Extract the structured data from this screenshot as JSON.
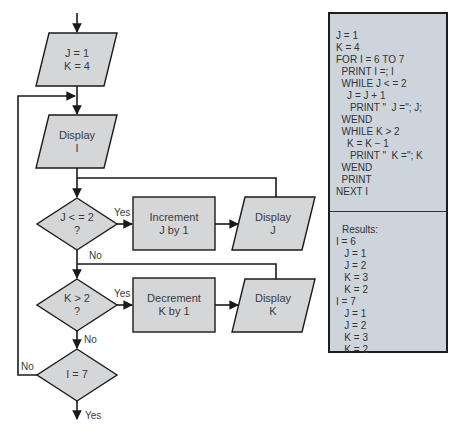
{
  "flowchart": {
    "nodes": {
      "init": {
        "line1": "J = 1",
        "line2": "K = 4"
      },
      "display_i": {
        "line1": "Display",
        "line2": "I"
      },
      "decision_j": {
        "line1": "J < = 2",
        "line2": "?"
      },
      "increment_j": {
        "line1": "Increment",
        "line2": "J by 1"
      },
      "display_j": {
        "line1": "Display",
        "line2": "J"
      },
      "decision_k": {
        "line1": "K > 2",
        "line2": "?"
      },
      "decrement_k": {
        "line1": "Decrement",
        "line2": "K by 1"
      },
      "display_k": {
        "line1": "Display",
        "line2": "K"
      },
      "decision_i": {
        "line1": "I = 7"
      }
    },
    "edge_labels": {
      "j_yes": "Yes",
      "j_no": "No",
      "k_yes": "Yes",
      "k_no": "No",
      "i_no": "No",
      "i_yes": "Yes"
    },
    "colors": {
      "shape_fill": "#d4d6d8",
      "line": "#1a1a1a",
      "panel_fill": "#cdd4dc"
    }
  },
  "code_panel": {
    "code_lines": [
      "J = 1",
      "K = 4",
      "FOR I = 6 TO 7",
      "  PRINT I =; I",
      "  WHILE J < = 2",
      "    J = J + 1",
      "     PRINT \"  J =\"; J;",
      "  WEND",
      "  WHILE K > 2",
      "    K = K − 1",
      "     PRINT \"  K =\"; K",
      "  WEND",
      "  PRINT",
      "NEXT I"
    ],
    "results_title": "Results:",
    "results_lines": [
      "I = 6",
      "   J = 1",
      "   J = 2",
      "   K = 3",
      "   K = 2",
      "I = 7",
      "   J = 1",
      "   J = 2",
      "   K = 3",
      "   K = 2"
    ]
  }
}
